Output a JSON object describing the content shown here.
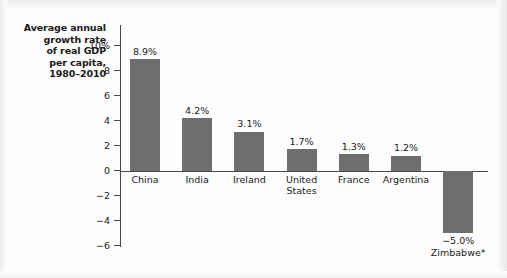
{
  "chart_data": {
    "type": "bar",
    "title_lines": [
      "Average annual",
      "growth rate",
      "of real GDP",
      "per capita,",
      "1980–2010"
    ],
    "xlabel": "",
    "ylabel": "",
    "ylim": [
      -6,
      10
    ],
    "grid": false,
    "legend": "none",
    "bar_color": "#6e6e6e",
    "axis_color": "#4a4a4a",
    "text_color": "#1a1a1a",
    "background": "#fdfdfd",
    "categories": [
      "China",
      "India",
      "Ireland",
      "United States",
      "France",
      "Argentina",
      "Zimbabwe*"
    ],
    "values": [
      8.9,
      4.2,
      3.1,
      1.7,
      1.3,
      1.2,
      -5.0
    ],
    "data_labels": [
      "8.9%",
      "4.2%",
      "3.1%",
      "1.7%",
      "1.3%",
      "1.2%",
      "−5.0%"
    ],
    "category_lines": [
      [
        "China"
      ],
      [
        "India"
      ],
      [
        "Ireland"
      ],
      [
        "United",
        "States"
      ],
      [
        "France"
      ],
      [
        "Argentina"
      ],
      [
        "Zimbabwe*"
      ]
    ],
    "yticks": [
      10,
      8,
      6,
      4,
      2,
      0,
      -2,
      -4,
      -6
    ],
    "ytick_labels": [
      "10%",
      "8",
      "6",
      "4",
      "2",
      "0",
      "−2",
      "−4",
      "−6"
    ]
  }
}
